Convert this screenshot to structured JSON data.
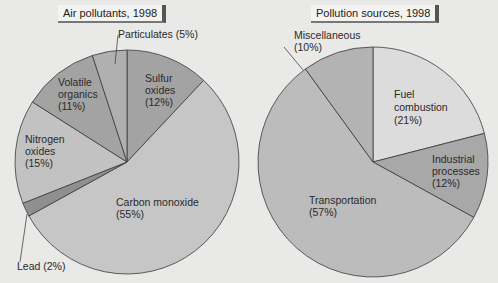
{
  "charts": {
    "left": {
      "title": "Air pollutants, 1998",
      "labels": {
        "particulates": [
          "Particulates (5%)"
        ],
        "volatile": [
          "Volatile",
          "organics",
          "(11%)"
        ],
        "sulfur": [
          "Sulfur",
          "oxides",
          "(12%)"
        ],
        "nitrogen": [
          "Nitrogen",
          "oxides",
          "(15%)"
        ],
        "carbon": [
          "Carbon monoxide",
          "(55%)"
        ],
        "lead": [
          "Lead (2%)"
        ]
      }
    },
    "right": {
      "title": "Pollution sources, 1998",
      "labels": {
        "misc": [
          "Miscellaneous",
          "(10%)"
        ],
        "fuel": [
          "Fuel",
          "combustion",
          "(21%)"
        ],
        "industrial": [
          "Industrial",
          "processes",
          "(12%)"
        ],
        "transport": [
          "Transportation",
          "(57%)"
        ]
      }
    }
  },
  "chart_data": [
    {
      "type": "pie",
      "title": "Air pollutants, 1998",
      "categories": [
        "Sulfur oxides",
        "Carbon monoxide",
        "Lead",
        "Nitrogen oxides",
        "Volatile organics",
        "Particulates"
      ],
      "values": [
        12,
        55,
        2,
        15,
        11,
        5
      ],
      "unit": "%",
      "colors": [
        "#a3a3a3",
        "#c6c6c6",
        "#8f8f8f",
        "#c2c2c2",
        "#a3a3a3",
        "#b0b0b0"
      ],
      "start_angle_deg": 0,
      "direction": "clockwise from 12 o'clock"
    },
    {
      "type": "pie",
      "title": "Pollution sources, 1998",
      "categories": [
        "Fuel combustion",
        "Industrial processes",
        "Transportation",
        "Miscellaneous"
      ],
      "values": [
        21,
        12,
        57,
        10
      ],
      "unit": "%",
      "colors": [
        "#dcdcdc",
        "#a8a8a8",
        "#bcbcbc",
        "#b3b3b3"
      ],
      "start_angle_deg": 0,
      "direction": "clockwise from 12 o'clock"
    }
  ]
}
